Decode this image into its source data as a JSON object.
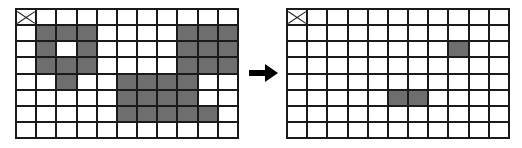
{
  "diagram": {
    "colors": {
      "cell_fill": "#6e6e6e",
      "cell_empty": "#ffffff",
      "grid_line": "#1a1a1a",
      "arrow": "#000000"
    },
    "grid_geometry": {
      "columns": 11,
      "rows": 8
    },
    "panels": [
      {
        "id": "before",
        "name": "input-grid",
        "label": "",
        "origin_marker": {
          "symbol": "x-cross",
          "row": 0,
          "col": 0
        },
        "filled_cells": [
          [
            1,
            1
          ],
          [
            1,
            2
          ],
          [
            1,
            3
          ],
          [
            1,
            8
          ],
          [
            1,
            9
          ],
          [
            1,
            10
          ],
          [
            2,
            1
          ],
          [
            2,
            3
          ],
          [
            2,
            8
          ],
          [
            2,
            9
          ],
          [
            2,
            10
          ],
          [
            3,
            1
          ],
          [
            3,
            2
          ],
          [
            3,
            3
          ],
          [
            3,
            8
          ],
          [
            3,
            9
          ],
          [
            3,
            10
          ],
          [
            4,
            2
          ],
          [
            4,
            5
          ],
          [
            4,
            6
          ],
          [
            4,
            7
          ],
          [
            4,
            8
          ],
          [
            5,
            5
          ],
          [
            5,
            6
          ],
          [
            5,
            7
          ],
          [
            5,
            8
          ],
          [
            6,
            5
          ],
          [
            6,
            6
          ],
          [
            6,
            7
          ],
          [
            6,
            8
          ],
          [
            6,
            9
          ]
        ],
        "filled_count": 31
      },
      {
        "id": "after",
        "name": "output-grid",
        "label": "",
        "origin_marker": {
          "symbol": "x-cross",
          "row": 0,
          "col": 0
        },
        "filled_cells": [
          [
            2,
            8
          ],
          [
            5,
            5
          ],
          [
            5,
            6
          ]
        ],
        "filled_count": 3
      }
    ],
    "arrow": {
      "direction": "right",
      "glyph": "arrow-right-icon"
    }
  }
}
